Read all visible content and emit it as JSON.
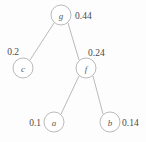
{
  "diagram": {
    "type": "binary-tree",
    "title": "",
    "colors": {
      "stroke": "#a8a8a8",
      "text": "#4a4a4a",
      "background": "#fdfdfd",
      "node_fill": "#ffffff"
    },
    "nodes": [
      {
        "id": "g",
        "label": "g",
        "weight": "0.44",
        "cx": 61,
        "cy": 15,
        "r": 10,
        "weight_x": 75,
        "weight_y": 19,
        "weight_anchor": "start"
      },
      {
        "id": "c",
        "label": "c",
        "weight": "0.2",
        "cx": 23,
        "cy": 68,
        "r": 10,
        "weight_x": 19,
        "weight_y": 55,
        "weight_anchor": "end"
      },
      {
        "id": "f",
        "label": "f",
        "weight": "0.24",
        "cx": 86,
        "cy": 68,
        "r": 10,
        "weight_x": 88,
        "weight_y": 56,
        "weight_anchor": "start"
      },
      {
        "id": "a",
        "label": "a",
        "weight": "0.1",
        "cx": 54,
        "cy": 122,
        "r": 10,
        "weight_x": 41,
        "weight_y": 126,
        "weight_anchor": "end"
      },
      {
        "id": "b",
        "label": "b",
        "weight": "0.14",
        "cx": 110,
        "cy": 122,
        "r": 10,
        "weight_x": 122,
        "weight_y": 126,
        "weight_anchor": "start"
      }
    ],
    "edges": [
      {
        "from": "g",
        "to": "c",
        "x1": 54,
        "y1": 23,
        "x2": 30,
        "y2": 60
      },
      {
        "from": "g",
        "to": "f",
        "x1": 68,
        "y1": 23,
        "x2": 79,
        "y2": 60
      },
      {
        "from": "f",
        "to": "a",
        "x1": 79,
        "y1": 76,
        "x2": 61,
        "y2": 114
      },
      {
        "from": "f",
        "to": "b",
        "x1": 93,
        "y1": 76,
        "x2": 103,
        "y2": 114
      }
    ]
  }
}
